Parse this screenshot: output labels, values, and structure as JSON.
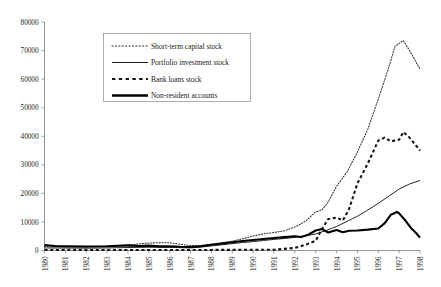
{
  "chart_data": {
    "type": "line",
    "title": "",
    "subtitle": "",
    "xlabel": "",
    "ylabel": "",
    "grid": false,
    "legend_position": "top-left-inside",
    "ylim": [
      0,
      80000
    ],
    "ytick_values": [
      0,
      10000,
      20000,
      30000,
      40000,
      50000,
      60000,
      70000,
      80000
    ],
    "ytick_labels": [
      "0",
      "10000",
      "20000",
      "30000",
      "40000",
      "50000",
      "60000",
      "70000",
      "80000"
    ],
    "x": [
      1980,
      1981,
      1982,
      1983,
      1984,
      1985,
      1986,
      1987,
      1988,
      1989,
      1990,
      1991,
      1992,
      1993,
      1994,
      1995,
      1996,
      1997,
      1998
    ],
    "xtick_labels": [
      "1980",
      "1981",
      "1982",
      "1983",
      "1984",
      "1985",
      "1986",
      "1987",
      "1988",
      "1989",
      "1990",
      "1991",
      "1992",
      "1993",
      "1994",
      "1995",
      "1996",
      "1997",
      "1998"
    ],
    "xlim": [
      1980,
      1998
    ],
    "series": [
      {
        "name": "Short-term capital stock",
        "style": "dotted",
        "values": [
          1400,
          1300,
          1250,
          1500,
          1900,
          2600,
          2700,
          1700,
          2200,
          3300,
          5100,
          6300,
          8200,
          13500,
          22500,
          34500,
          53000,
          72500,
          63500
        ],
        "dense_points": [
          [
            1980.0,
            1400
          ],
          [
            1980.5,
            1300
          ],
          [
            1981.0,
            1250
          ],
          [
            1981.5,
            1200
          ],
          [
            1982.0,
            1250
          ],
          [
            1982.5,
            1350
          ],
          [
            1983.0,
            1500
          ],
          [
            1983.5,
            1700
          ],
          [
            1984.0,
            1900
          ],
          [
            1984.5,
            2300
          ],
          [
            1985.0,
            2600
          ],
          [
            1985.5,
            2750
          ],
          [
            1986.0,
            2700
          ],
          [
            1986.5,
            2200
          ],
          [
            1987.0,
            1700
          ],
          [
            1987.5,
            1800
          ],
          [
            1988.0,
            2200
          ],
          [
            1988.5,
            2700
          ],
          [
            1989.0,
            3300
          ],
          [
            1989.5,
            4100
          ],
          [
            1990.0,
            5100
          ],
          [
            1990.5,
            5800
          ],
          [
            1991.0,
            6300
          ],
          [
            1991.5,
            6900
          ],
          [
            1992.0,
            8200
          ],
          [
            1992.5,
            10200
          ],
          [
            1993.0,
            13500
          ],
          [
            1993.3,
            14200
          ],
          [
            1993.6,
            17000
          ],
          [
            1994.0,
            22500
          ],
          [
            1994.5,
            27500
          ],
          [
            1995.0,
            34500
          ],
          [
            1995.5,
            42500
          ],
          [
            1996.0,
            53000
          ],
          [
            1996.5,
            64000
          ],
          [
            1996.8,
            71500
          ],
          [
            1997.0,
            72500
          ],
          [
            1997.2,
            73500
          ],
          [
            1997.5,
            70000
          ],
          [
            1998.0,
            63500
          ]
        ]
      },
      {
        "name": "Portfolio investment stock",
        "style": "solid-thin",
        "values": [
          900,
          850,
          820,
          900,
          1050,
          1150,
          1100,
          900,
          1600,
          2400,
          3100,
          3900,
          4600,
          5800,
          8400,
          12000,
          16500,
          21500,
          24500
        ],
        "dense_points": [
          [
            1980.0,
            900
          ],
          [
            1981.0,
            850
          ],
          [
            1982.0,
            820
          ],
          [
            1983.0,
            900
          ],
          [
            1984.0,
            1050
          ],
          [
            1985.0,
            1150
          ],
          [
            1986.0,
            1100
          ],
          [
            1987.0,
            900
          ],
          [
            1987.5,
            1200
          ],
          [
            1988.0,
            1600
          ],
          [
            1988.5,
            2000
          ],
          [
            1989.0,
            2400
          ],
          [
            1989.5,
            2800
          ],
          [
            1990.0,
            3100
          ],
          [
            1990.5,
            3500
          ],
          [
            1991.0,
            3900
          ],
          [
            1991.5,
            4200
          ],
          [
            1992.0,
            4600
          ],
          [
            1992.5,
            5100
          ],
          [
            1993.0,
            5800
          ],
          [
            1993.5,
            7000
          ],
          [
            1994.0,
            8400
          ],
          [
            1994.5,
            10200
          ],
          [
            1995.0,
            12000
          ],
          [
            1995.5,
            14200
          ],
          [
            1996.0,
            16500
          ],
          [
            1996.5,
            19000
          ],
          [
            1997.0,
            21500
          ],
          [
            1997.5,
            23300
          ],
          [
            1998.0,
            24500
          ]
        ]
      },
      {
        "name": "Bank loans stock",
        "style": "dashed-thick",
        "values": [
          200,
          180,
          170,
          160,
          170,
          180,
          190,
          200,
          210,
          220,
          240,
          260,
          900,
          3400,
          11500,
          23500,
          38500,
          41500,
          35000
        ],
        "dense_points": [
          [
            1980.0,
            200
          ],
          [
            1982.0,
            170
          ],
          [
            1984.0,
            170
          ],
          [
            1986.0,
            190
          ],
          [
            1988.0,
            210
          ],
          [
            1990.0,
            240
          ],
          [
            1991.0,
            260
          ],
          [
            1992.0,
            900
          ],
          [
            1992.5,
            2000
          ],
          [
            1993.0,
            3400
          ],
          [
            1993.3,
            7500
          ],
          [
            1993.6,
            11000
          ],
          [
            1994.0,
            11500
          ],
          [
            1994.3,
            10500
          ],
          [
            1994.6,
            14500
          ],
          [
            1995.0,
            23500
          ],
          [
            1995.5,
            30500
          ],
          [
            1996.0,
            38500
          ],
          [
            1996.3,
            39500
          ],
          [
            1996.6,
            38200
          ],
          [
            1997.0,
            38800
          ],
          [
            1997.2,
            41500
          ],
          [
            1997.5,
            39500
          ],
          [
            1998.0,
            35000
          ]
        ]
      },
      {
        "name": "Non-resident accounts",
        "style": "solid-thick",
        "values": [
          1900,
          1500,
          1400,
          1500,
          1800,
          1700,
          1500,
          1200,
          2000,
          2900,
          3700,
          4400,
          5000,
          7000,
          7200,
          7000,
          7700,
          13000,
          4500
        ],
        "dense_points": [
          [
            1980.0,
            1900
          ],
          [
            1980.5,
            1550
          ],
          [
            1981.0,
            1500
          ],
          [
            1982.0,
            1400
          ],
          [
            1983.0,
            1500
          ],
          [
            1984.0,
            1800
          ],
          [
            1984.5,
            1600
          ],
          [
            1985.0,
            1700
          ],
          [
            1985.5,
            1450
          ],
          [
            1986.0,
            1500
          ],
          [
            1986.5,
            1300
          ],
          [
            1987.0,
            1200
          ],
          [
            1987.5,
            1500
          ],
          [
            1988.0,
            2000
          ],
          [
            1988.5,
            2450
          ],
          [
            1989.0,
            2900
          ],
          [
            1989.5,
            3300
          ],
          [
            1990.0,
            3700
          ],
          [
            1990.5,
            4050
          ],
          [
            1991.0,
            4400
          ],
          [
            1991.5,
            4700
          ],
          [
            1992.0,
            5000
          ],
          [
            1992.3,
            4700
          ],
          [
            1992.6,
            5400
          ],
          [
            1993.0,
            7000
          ],
          [
            1993.3,
            7500
          ],
          [
            1993.6,
            6300
          ],
          [
            1994.0,
            7200
          ],
          [
            1994.3,
            6400
          ],
          [
            1994.6,
            6900
          ],
          [
            1995.0,
            7000
          ],
          [
            1995.5,
            7300
          ],
          [
            1996.0,
            7700
          ],
          [
            1996.3,
            9500
          ],
          [
            1996.6,
            12500
          ],
          [
            1996.9,
            13500
          ],
          [
            1997.0,
            13000
          ],
          [
            1997.3,
            10500
          ],
          [
            1997.6,
            7600
          ],
          [
            1997.8,
            6200
          ],
          [
            1998.0,
            4500
          ]
        ]
      }
    ],
    "annotations": []
  },
  "legend": {
    "entries": [
      {
        "label": "Short-term capital stock",
        "marker": "dotted-line"
      },
      {
        "label": "Portfolio investment stock",
        "marker": "solid-thin-line"
      },
      {
        "label": "Bank loans stock",
        "marker": "dashed-thick-line"
      },
      {
        "label": "Non-resident accounts",
        "marker": "solid-thick-line"
      }
    ]
  }
}
